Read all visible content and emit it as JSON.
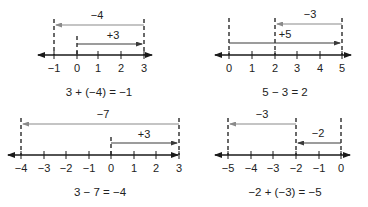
{
  "colors": {
    "axis": "#1a1a1a",
    "dark_arrow": "#3a3a3a",
    "gray_arrow": "#8a8a8a",
    "dashed": "#1a1a1a"
  },
  "panels": [
    {
      "id": "top-left",
      "equation": "3 + (−4) = −1",
      "axis_y": 55,
      "ticks": [
        {
          "x": 54,
          "label": "−1"
        },
        {
          "x": 77,
          "label": "0"
        },
        {
          "x": 98,
          "label": "1"
        },
        {
          "x": 121,
          "label": "2"
        },
        {
          "x": 144,
          "label": "3"
        }
      ],
      "axis_x1": 38,
      "axis_x2": 158,
      "dashes": [
        {
          "x": 54,
          "y1": 19,
          "y2": 55
        },
        {
          "x": 77,
          "y1": 36,
          "y2": 55
        },
        {
          "x": 144,
          "y1": 19,
          "y2": 55
        }
      ],
      "arrows": [
        {
          "label": "−4",
          "from": 144,
          "to": 56,
          "y": 25,
          "label_x": 97,
          "label_y": 19,
          "color": "gray"
        },
        {
          "label": "+3",
          "from": 77,
          "to": 142,
          "y": 44,
          "label_x": 113,
          "label_y": 39,
          "color": "dark"
        }
      ],
      "eq_x": 99,
      "eq_y": 96
    },
    {
      "id": "top-right",
      "equation": "5 − 3 = 2",
      "axis_y": 55,
      "ticks": [
        {
          "x": 229,
          "label": "0"
        },
        {
          "x": 252,
          "label": "1"
        },
        {
          "x": 275,
          "label": "2"
        },
        {
          "x": 297,
          "label": "3"
        },
        {
          "x": 320,
          "label": "4"
        },
        {
          "x": 342,
          "label": "5"
        }
      ],
      "axis_x1": 215,
      "axis_x2": 357,
      "dashes": [
        {
          "x": 229,
          "y1": 18,
          "y2": 55
        },
        {
          "x": 275,
          "y1": 18,
          "y2": 55
        },
        {
          "x": 342,
          "y1": 18,
          "y2": 55
        }
      ],
      "arrows": [
        {
          "label": "−3",
          "from": 342,
          "to": 277,
          "y": 24,
          "label_x": 310,
          "label_y": 18,
          "color": "gray"
        },
        {
          "label": "+5",
          "from": 229,
          "to": 340,
          "y": 43,
          "label_x": 285,
          "label_y": 38,
          "color": "dark"
        }
      ],
      "eq_x": 285,
      "eq_y": 96
    },
    {
      "id": "bottom-left",
      "equation": "3 − 7 = −4",
      "axis_y": 155,
      "ticks": [
        {
          "x": 21,
          "label": "−4"
        },
        {
          "x": 44,
          "label": "−3"
        },
        {
          "x": 66,
          "label": "−2"
        },
        {
          "x": 89,
          "label": "−1"
        },
        {
          "x": 111,
          "label": "0"
        },
        {
          "x": 134,
          "label": "1"
        },
        {
          "x": 156,
          "label": "2"
        },
        {
          "x": 179,
          "label": "3"
        }
      ],
      "axis_x1": 8,
      "axis_x2": 184,
      "dashes": [
        {
          "x": 21,
          "y1": 118,
          "y2": 155
        },
        {
          "x": 111,
          "y1": 137,
          "y2": 155
        },
        {
          "x": 179,
          "y1": 118,
          "y2": 155
        }
      ],
      "arrows": [
        {
          "label": "−7",
          "from": 179,
          "to": 23,
          "y": 124,
          "label_x": 103,
          "label_y": 118,
          "color": "gray"
        },
        {
          "label": "+3",
          "from": 111,
          "to": 177,
          "y": 143,
          "label_x": 144,
          "label_y": 138,
          "color": "dark"
        }
      ],
      "eq_x": 100,
      "eq_y": 196
    },
    {
      "id": "bottom-right",
      "equation": "−2 + (−3) = −5",
      "axis_y": 155,
      "ticks": [
        {
          "x": 228,
          "label": "−5"
        },
        {
          "x": 251,
          "label": "−4"
        },
        {
          "x": 273,
          "label": "−3"
        },
        {
          "x": 296,
          "label": "−2"
        },
        {
          "x": 319,
          "label": "−1"
        },
        {
          "x": 341,
          "label": "0"
        }
      ],
      "axis_x1": 215,
      "axis_x2": 356,
      "dashes": [
        {
          "x": 228,
          "y1": 118,
          "y2": 155
        },
        {
          "x": 296,
          "y1": 118,
          "y2": 155
        },
        {
          "x": 341,
          "y1": 118,
          "y2": 155
        }
      ],
      "arrows": [
        {
          "label": "−3",
          "from": 296,
          "to": 230,
          "y": 124,
          "label_x": 262,
          "label_y": 118,
          "color": "gray"
        },
        {
          "label": "−2",
          "from": 341,
          "to": 298,
          "y": 143,
          "label_x": 318,
          "label_y": 137,
          "color": "dark"
        }
      ],
      "eq_x": 285,
      "eq_y": 196
    }
  ],
  "stray_arrowhead": {
    "x": 184,
    "y": 155
  }
}
